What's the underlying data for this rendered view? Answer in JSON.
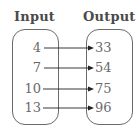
{
  "mapping": {
    "input_header": "Input",
    "output_header": "Output",
    "pairs": [
      {
        "input": "4",
        "output": "33"
      },
      {
        "input": "7",
        "output": "54"
      },
      {
        "input": "10",
        "output": "75"
      },
      {
        "input": "13",
        "output": "96"
      }
    ],
    "colors": {
      "header": "#4a4a4a",
      "text": "#6a6a6a",
      "border": "#6a6a6a",
      "arrow": "#222222"
    }
  }
}
